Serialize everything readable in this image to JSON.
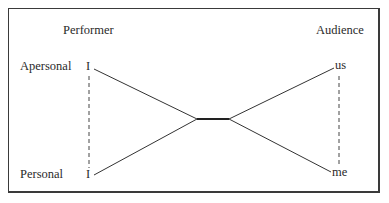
{
  "diagram": {
    "headers": {
      "performer": "Performer",
      "audience": "Audience"
    },
    "row_labels": {
      "apersonal": "Apersonal",
      "personal": "Personal"
    },
    "nodes": {
      "performer_top": "I",
      "performer_bottom": "I",
      "audience_top": "us",
      "audience_bottom": "me"
    },
    "colors": {
      "line": "#333333",
      "border": "#3a3a3a",
      "text": "#2a2a2a"
    }
  }
}
